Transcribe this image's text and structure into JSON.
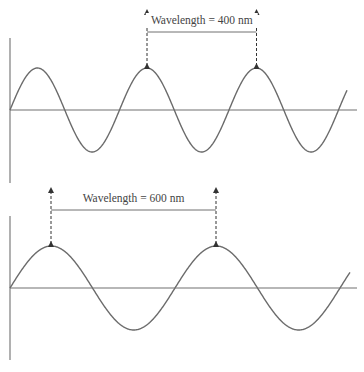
{
  "panels": [
    {
      "id": "top",
      "label": "Wavelength = 400 nm",
      "wavelength_nm": 400,
      "geometry": {
        "axis_y": 110,
        "vaxis_top": 38,
        "vaxis_bottom": 183,
        "x_start": 10,
        "x_end": 357,
        "wave_end": 347,
        "wavelength_px": 109.5,
        "amplitude_px": 42,
        "marker_x1": 147,
        "marker_x2": 256.5,
        "bracket_y": 32,
        "arrow_top": 12,
        "label_y": 24
      }
    },
    {
      "id": "bottom",
      "label": "Wavelength = 600 nm",
      "wavelength_nm": 600,
      "geometry": {
        "axis_y": 288,
        "vaxis_top": 216,
        "vaxis_bottom": 360,
        "x_start": 10,
        "x_end": 357,
        "wave_end": 350,
        "wavelength_px": 165,
        "amplitude_px": 42,
        "marker_x1": 51,
        "marker_x2": 216,
        "bracket_y": 210,
        "arrow_top": 190,
        "label_y": 202
      }
    }
  ],
  "colors": {
    "wave": "#6b6b6b",
    "axis": "#707070",
    "marker": "#333333",
    "text": "#444444"
  }
}
